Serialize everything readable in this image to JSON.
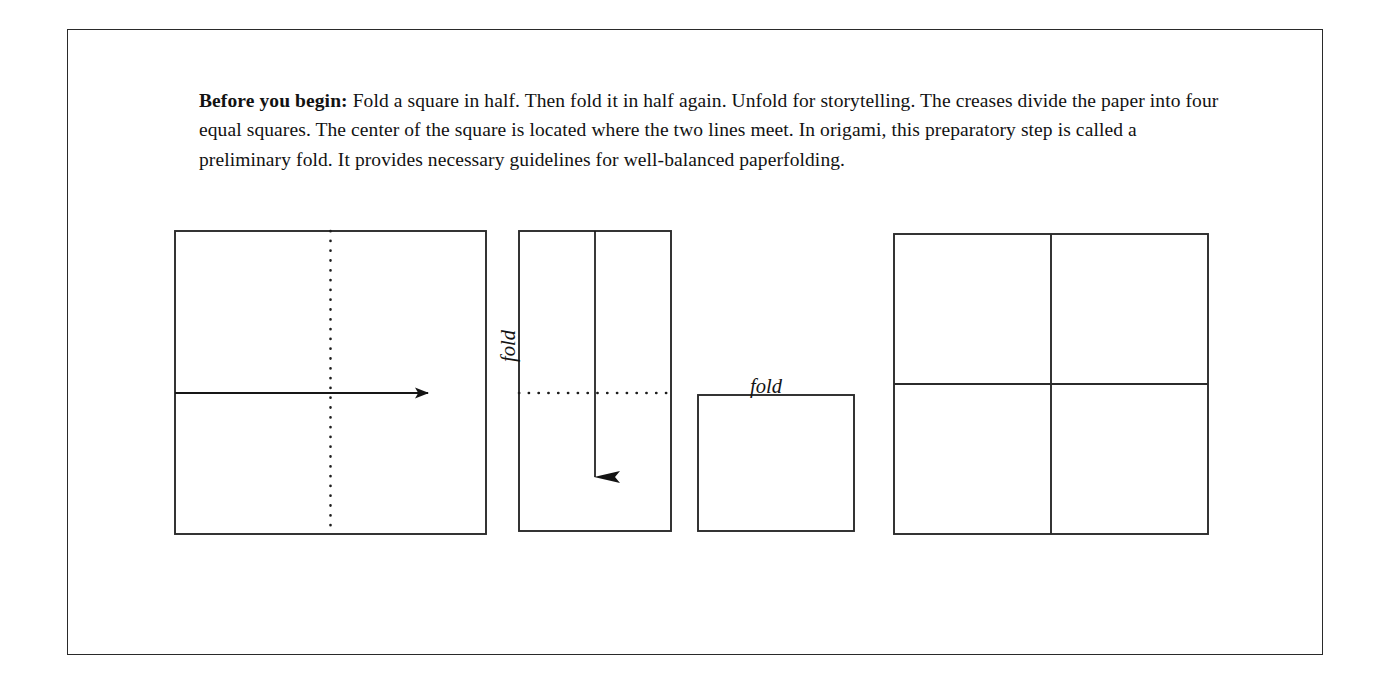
{
  "page": {
    "background_color": "#ffffff",
    "border_color": "#2a2a2a",
    "ink_color": "#141414"
  },
  "intro": {
    "lead": "Before you begin:",
    "body": " Fold a square in half. Then fold it in half again. Unfold for storytelling. The creases divide the paper into four equal squares. The center of the square is located where the two lines meet. In origami, this preparatory step is called a preliminary fold. It provides necessary guidelines for well-balanced paperfolding."
  },
  "labels": {
    "fold_vertical": "fold",
    "fold_horizontal": "fold"
  },
  "diagram": {
    "type": "origami-preliminary-fold-sequence",
    "steps": [
      {
        "id": "step-1-full-square",
        "shape": "square",
        "x": 107,
        "y": 201,
        "width": 311,
        "height": 303,
        "crease": {
          "orientation": "vertical",
          "style": "dotted",
          "position": "center"
        },
        "arrow": {
          "direction": "right",
          "style": "solid",
          "from_x": 107,
          "to_x": 373,
          "y": 363
        }
      },
      {
        "id": "step-2-half-rectangle",
        "shape": "rectangle",
        "x": 451,
        "y": 201,
        "width": 152,
        "height": 300,
        "crease": {
          "orientation": "horizontal",
          "style": "dotted",
          "position": "center"
        },
        "arrow": {
          "direction": "down",
          "style": "solid",
          "x": 527,
          "from_y": 201,
          "to_y": 471
        }
      },
      {
        "id": "step-3-quarter-square",
        "shape": "square",
        "x": 630,
        "y": 365,
        "width": 156,
        "height": 136,
        "crease": null,
        "arrow": null
      },
      {
        "id": "step-4-unfolded-four-squares",
        "shape": "square",
        "x": 826,
        "y": 204,
        "width": 314,
        "height": 300,
        "crease": {
          "orientation": "cross",
          "style": "solid",
          "position": "center"
        },
        "arrow": null
      }
    ]
  }
}
